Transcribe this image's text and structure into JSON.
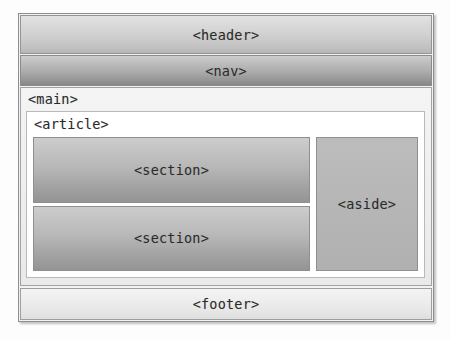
{
  "diagram": {
    "kind": "html5-semantic-layout-diagram",
    "header": {
      "label": "<header>"
    },
    "nav": {
      "label": "<nav>"
    },
    "main": {
      "label": "<main>",
      "article": {
        "label": "<article>",
        "sections": [
          {
            "label": "<section>"
          },
          {
            "label": "<section>"
          }
        ],
        "aside": {
          "label": "<aside>"
        }
      }
    },
    "footer": {
      "label": "<footer>"
    }
  },
  "colors": {
    "page_background": "#fdfdfd",
    "frame_border": "#8e8e8e",
    "header_fill_top": "#e2e2e2",
    "header_fill_bottom": "#b6b6b6",
    "nav_fill_top": "#cdcdcd",
    "nav_fill_bottom": "#878787",
    "main_fill": "#f0f0f0",
    "article_fill": "#ffffff",
    "section_fill_top": "#cdcdcd",
    "section_fill_bottom": "#949494",
    "aside_fill": "#b6b6b6",
    "footer_fill_top": "#f3f3f3",
    "footer_fill_bottom": "#dedede",
    "text": "#2a2a2a"
  }
}
